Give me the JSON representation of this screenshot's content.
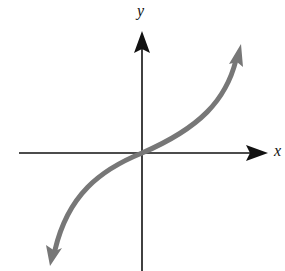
{
  "diagram": {
    "type": "function-graph",
    "axes": {
      "x_label": "x",
      "y_label": "y",
      "color": "#111111"
    },
    "curve": {
      "description": "increasing S-shaped cubic-like curve through the origin, arrows at both ends",
      "color": "#777777"
    }
  }
}
